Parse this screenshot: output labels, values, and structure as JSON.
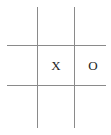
{
  "board": {
    "title": "Tic Tac Toe Board",
    "width": 111,
    "height": 135,
    "background_color": "#ffffff",
    "line_color": "#8a8a8a",
    "mark_color": "#232323",
    "rows": 3,
    "columns": 3,
    "cells": [
      [
        {
          "mark": "",
          "name": "cell-top-left",
          "row": 0,
          "col": 0
        },
        {
          "mark": "",
          "name": "cell-top-center",
          "row": 0,
          "col": 1
        },
        {
          "mark": "",
          "name": "cell-top-right",
          "row": 0,
          "col": 2
        }
      ],
      [
        {
          "mark": "",
          "name": "cell-middle-left",
          "row": 1,
          "col": 0
        },
        {
          "mark": "X",
          "name": "cell-middle-center",
          "row": 1,
          "col": 1
        },
        {
          "mark": "O",
          "name": "cell-middle-right",
          "row": 1,
          "col": 2
        }
      ],
      [
        {
          "mark": "",
          "name": "cell-bottom-left",
          "row": 2,
          "col": 0
        },
        {
          "mark": "",
          "name": "cell-bottom-center",
          "row": 2,
          "col": 1
        },
        {
          "mark": "",
          "name": "cell-bottom-right",
          "row": 2,
          "col": 2
        }
      ]
    ],
    "grid_lines": {
      "vertical": [
        {
          "name": "grid-line-vertical-left",
          "x": 37
        },
        {
          "name": "grid-line-vertical-right",
          "x": 74
        }
      ],
      "horizontal": [
        {
          "name": "grid-line-horizontal-top",
          "y": 45
        },
        {
          "name": "grid-line-horizontal-bottom",
          "y": 85
        }
      ]
    }
  }
}
